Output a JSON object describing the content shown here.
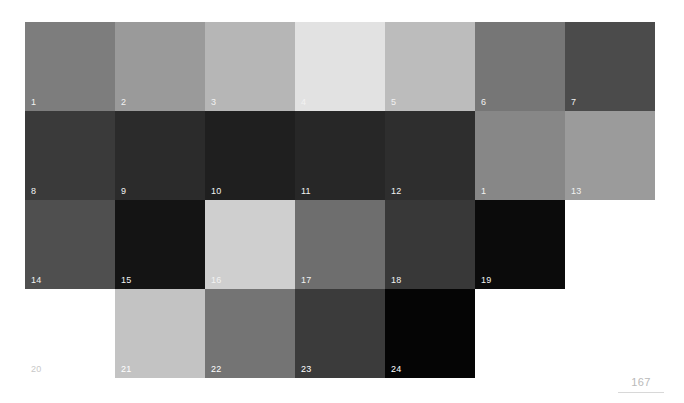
{
  "page": {
    "background": "#ffffff",
    "number": "167"
  },
  "chart_data": {
    "type": "heatmap",
    "title": "",
    "xlabel": "",
    "ylabel": "",
    "grid": false,
    "legend": "none",
    "columns": 7,
    "rows": 4,
    "cell_width": 90,
    "cell_height": 89,
    "origin_x": 25,
    "origin_y": 22,
    "cells": [
      {
        "label": "1",
        "row": 1,
        "col": 1,
        "color": "#7d7d7d",
        "value": 125,
        "label_color": "#f2f2f2"
      },
      {
        "label": "2",
        "row": 1,
        "col": 2,
        "color": "#9a9a9a",
        "value": 154,
        "label_color": "#f2f2f2"
      },
      {
        "label": "3",
        "row": 1,
        "col": 3,
        "color": "#b6b6b6",
        "value": 182,
        "label_color": "#f2f2f2"
      },
      {
        "label": "4",
        "row": 1,
        "col": 4,
        "color": "#e2e2e2",
        "value": 226,
        "label_color": "#f2f2f2"
      },
      {
        "label": "5",
        "row": 1,
        "col": 5,
        "color": "#bcbcbc",
        "value": 188,
        "label_color": "#f2f2f2"
      },
      {
        "label": "6",
        "row": 1,
        "col": 6,
        "color": "#767676",
        "value": 118,
        "label_color": "#f2f2f2"
      },
      {
        "label": "7",
        "row": 1,
        "col": 7,
        "color": "#4b4b4b",
        "value": 75,
        "label_color": "#f2f2f2"
      },
      {
        "label": "8",
        "row": 2,
        "col": 1,
        "color": "#3a3a3a",
        "value": 58,
        "label_color": "#f2f2f2"
      },
      {
        "label": "9",
        "row": 2,
        "col": 2,
        "color": "#2b2b2b",
        "value": 43,
        "label_color": "#f2f2f2"
      },
      {
        "label": "10",
        "row": 2,
        "col": 3,
        "color": "#1f1f1f",
        "value": 31,
        "label_color": "#f2f2f2"
      },
      {
        "label": "11",
        "row": 2,
        "col": 4,
        "color": "#272727",
        "value": 39,
        "label_color": "#f2f2f2"
      },
      {
        "label": "12",
        "row": 2,
        "col": 5,
        "color": "#2e2e2e",
        "value": 46,
        "label_color": "#f2f2f2"
      },
      {
        "label": "1",
        "row": 2,
        "col": 6,
        "color": "#878787",
        "value": 135,
        "label_color": "#f2f2f2"
      },
      {
        "label": "13",
        "row": 2,
        "col": 7,
        "color": "#9b9b9b",
        "value": 155,
        "label_color": "#f2f2f2"
      },
      {
        "label": "14",
        "row": 3,
        "col": 1,
        "color": "#4f4f4f",
        "value": 79,
        "label_color": "#f2f2f2"
      },
      {
        "label": "15",
        "row": 3,
        "col": 2,
        "color": "#141414",
        "value": 20,
        "label_color": "#f2f2f2"
      },
      {
        "label": "16",
        "row": 3,
        "col": 3,
        "color": "#cfcfcf",
        "value": 207,
        "label_color": "#f2f2f2"
      },
      {
        "label": "17",
        "row": 3,
        "col": 4,
        "color": "#6e6e6e",
        "value": 110,
        "label_color": "#f2f2f2"
      },
      {
        "label": "18",
        "row": 3,
        "col": 5,
        "color": "#383838",
        "value": 56,
        "label_color": "#f2f2f2"
      },
      {
        "label": "19",
        "row": 3,
        "col": 6,
        "color": "#0b0b0b",
        "value": 11,
        "label_color": "#f2f2f2"
      },
      {
        "label": "20",
        "row": 4,
        "col": 1,
        "color": "#ffffff",
        "value": 255,
        "label_color": "#c8c8c8"
      },
      {
        "label": "21",
        "row": 4,
        "col": 2,
        "color": "#c3c3c3",
        "value": 195,
        "label_color": "#ffffff"
      },
      {
        "label": "22",
        "row": 4,
        "col": 3,
        "color": "#747474",
        "value": 116,
        "label_color": "#ffffff"
      },
      {
        "label": "23",
        "row": 4,
        "col": 4,
        "color": "#3b3b3b",
        "value": 59,
        "label_color": "#ffffff"
      },
      {
        "label": "24",
        "row": 4,
        "col": 5,
        "color": "#050505",
        "value": 5,
        "label_color": "#ffffff"
      }
    ]
  }
}
